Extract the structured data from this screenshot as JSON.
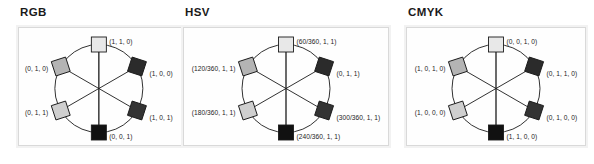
{
  "figure": {
    "caption": "",
    "panel_count": 3
  },
  "panels": [
    {
      "id": "rgb",
      "title": "RGB",
      "title_x": 20,
      "panel_x": 18,
      "panel_w": 165,
      "nodes": [
        {
          "name": "yellow",
          "label": "(1, 1, 0)",
          "pos": "top",
          "fill": "#e8e8e8",
          "rotated": false,
          "side": "r"
        },
        {
          "name": "red",
          "label": "(1, 0, 0)",
          "pos": "upper-right",
          "fill": "#2b2b2b",
          "rotated": true,
          "side": "r"
        },
        {
          "name": "magenta",
          "label": "(1, 0, 1)",
          "pos": "lower-right",
          "fill": "#333333",
          "rotated": true,
          "side": "r"
        },
        {
          "name": "blue",
          "label": "(0, 0, 1)",
          "pos": "bottom",
          "fill": "#111111",
          "rotated": false,
          "side": "r"
        },
        {
          "name": "cyan",
          "label": "(0, 1, 1)",
          "pos": "lower-left",
          "fill": "#cfcfcf",
          "rotated": true,
          "side": "l"
        },
        {
          "name": "green",
          "label": "(0, 1, 0)",
          "pos": "upper-left",
          "fill": "#b4b4b4",
          "rotated": true,
          "side": "l"
        }
      ]
    },
    {
      "id": "hsv",
      "title": "HSV",
      "title_x": 185,
      "panel_x": 183,
      "panel_w": 206,
      "nodes": [
        {
          "name": "yellow",
          "label": "(60/360, 1, 1)",
          "pos": "top",
          "fill": "#e8e8e8",
          "rotated": false,
          "side": "r"
        },
        {
          "name": "red",
          "label": "(0, 1, 1)",
          "pos": "upper-right",
          "fill": "#2b2b2b",
          "rotated": true,
          "side": "r"
        },
        {
          "name": "magenta",
          "label": "(300/360, 1, 1)",
          "pos": "lower-right",
          "fill": "#333333",
          "rotated": true,
          "side": "r"
        },
        {
          "name": "blue",
          "label": "(240/360, 1, 1)",
          "pos": "bottom",
          "fill": "#111111",
          "rotated": false,
          "side": "r"
        },
        {
          "name": "cyan",
          "label": "(180/360, 1, 1)",
          "pos": "lower-left",
          "fill": "#cfcfcf",
          "rotated": true,
          "side": "l"
        },
        {
          "name": "green",
          "label": "(120/360, 1, 1)",
          "pos": "upper-left",
          "fill": "#b4b4b4",
          "rotated": true,
          "side": "l"
        }
      ]
    },
    {
      "id": "cmyk",
      "title": "CMYK",
      "title_x": 408,
      "panel_x": 406,
      "panel_w": 180,
      "nodes": [
        {
          "name": "yellow",
          "label": "(0, 0, 1, 0)",
          "pos": "top",
          "fill": "#e8e8e8",
          "rotated": false,
          "side": "r"
        },
        {
          "name": "red",
          "label": "(0, 1, 1, 0)",
          "pos": "upper-right",
          "fill": "#2b2b2b",
          "rotated": true,
          "side": "r"
        },
        {
          "name": "magenta",
          "label": "(0, 1, 0, 0)",
          "pos": "lower-right",
          "fill": "#333333",
          "rotated": true,
          "side": "r"
        },
        {
          "name": "blue",
          "label": "(1, 1, 0, 0)",
          "pos": "bottom",
          "fill": "#111111",
          "rotated": false,
          "side": "r"
        },
        {
          "name": "cyan",
          "label": "(1, 0, 1, 0)",
          "pos": "lower-left",
          "fill": "#cfcfcf",
          "rotated": true,
          "side": "l"
        },
        {
          "name": "green",
          "label": "(1, 0, 1, 0)",
          "pos": "upper-left",
          "fill": "#b4b4b4",
          "rotated": true,
          "side": "l"
        }
      ]
    }
  ],
  "cmyk_left_labels_fix": {
    "upper_left": "(1, 0, 1, 0)",
    "lower_left": "(1, 0, 0, 0)"
  },
  "style": {
    "stroke": "#1b1b1b",
    "frame_border": "#d9d9d9",
    "frame_outer": "#f2f2f2",
    "background": "#ffffff"
  }
}
